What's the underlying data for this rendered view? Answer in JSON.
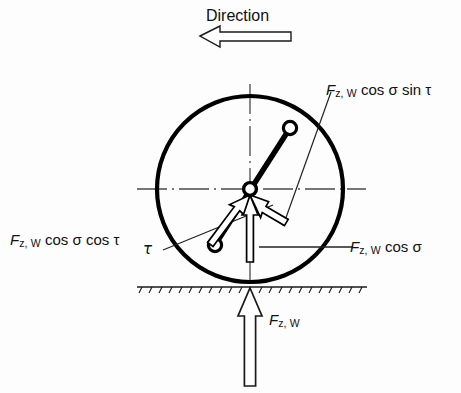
{
  "figure": {
    "background_color": "#fdfdfd",
    "line_color": "#000000"
  },
  "direction": {
    "label": "Direction",
    "arrow_icon": "arrow-left-icon",
    "arrow_direction": "left"
  },
  "labels": {
    "force_cos_sigma_sin_tau": {
      "symbol": "F",
      "subscript": "z, W",
      "expression": "cos σ sin τ",
      "full_text": "F z, W cos σ sin τ"
    },
    "force_cos_sigma_cos_tau": {
      "symbol": "F",
      "subscript": "z, W",
      "expression": "cos σ cos τ",
      "full_text": "F z, W cos σ cos τ"
    },
    "force_cos_sigma": {
      "symbol": "F",
      "subscript": "z, W",
      "expression": "cos σ",
      "full_text": "F z, W cos σ"
    },
    "force_fzw": {
      "symbol": "F",
      "subscript": "z, W",
      "expression": "",
      "full_text": "F z, W"
    },
    "angle_tau": {
      "symbol": "τ"
    }
  },
  "geometry": {
    "wheel": {
      "center_x": 250,
      "center_y": 189,
      "radius": 93,
      "stroke_width": 4.2
    },
    "hub": {
      "center_x": 250,
      "center_y": 189,
      "radius": 6.2
    },
    "axle_bar": {
      "end_upper_x": 290,
      "end_upper_y": 128,
      "end_lower_x": 215,
      "end_lower_y": 245,
      "joint_radius": 6.5,
      "stroke_width": 5
    },
    "ground_line": {
      "y": 287,
      "x_start": 137,
      "x_end": 367,
      "hatch_count": 22
    },
    "centerline_horizontal": {
      "y": 189,
      "x_start": 137,
      "x_end": 366
    },
    "centerline_vertical": {
      "x": 250,
      "y_start": 84,
      "y_end": 294
    },
    "arrows": {
      "force_vertical_down": {
        "tip_x": 250,
        "tip_y": 196,
        "tail_x": 250,
        "tail_y": 262
      },
      "force_down_left": {
        "tip_x": 250,
        "tip_y": 196,
        "tail_x": 211,
        "tail_y": 249
      },
      "force_down_right": {
        "tip_x": 250,
        "tip_y": 196,
        "tail_x": 286,
        "tail_y": 223
      },
      "force_up_ground": {
        "tip_x": 250,
        "tip_y": 288,
        "tail_x": 250,
        "tail_y": 386
      }
    },
    "leader_lines": {
      "to_cos_sigma_sin_tau": {
        "x1": 330,
        "y1": 90,
        "x2": 282,
        "y2": 227
      },
      "to_cos_sigma_cos_tau": {
        "x1": 163,
        "y1": 249,
        "x2": 272,
        "y2": 206
      },
      "to_cos_sigma": {
        "x1": 260,
        "y1": 247,
        "x2": 352,
        "y2": 247
      }
    }
  }
}
